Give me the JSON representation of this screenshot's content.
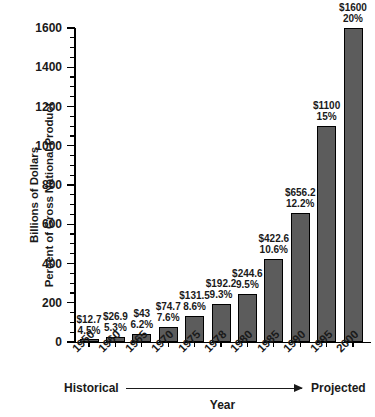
{
  "chart_data": {
    "type": "bar",
    "title": "",
    "xlabel": "Year",
    "ylabel": "Billions of Dollars Percent of Gross National Product",
    "ylabel_lines": [
      "Billions of Dollars",
      "Percent of Gross National Product"
    ],
    "ylim": [
      0,
      1600
    ],
    "ytick_step": 200,
    "yminor_step": 50,
    "grid": false,
    "legend": "none",
    "categories": [
      "1950",
      "1960",
      "1965",
      "1970",
      "1975",
      "1978",
      "1980",
      "1985",
      "1990",
      "1995",
      "2000"
    ],
    "values": [
      12.7,
      26.9,
      43,
      74.7,
      131.5,
      192.2,
      244.6,
      422.6,
      656.2,
      1100,
      1600
    ],
    "ytick_labels": [
      "1600",
      "1400",
      "1200",
      "1000",
      "800",
      "600",
      "400",
      "200",
      "0"
    ],
    "series": [
      {
        "name": "Billions of Dollars",
        "values": [
          12.7,
          26.9,
          43,
          74.7,
          131.5,
          192.2,
          244.6,
          422.6,
          656.2,
          1100,
          1600
        ]
      },
      {
        "name": "Percent of Gross National Product",
        "values": [
          4.5,
          5.3,
          6.2,
          7.6,
          8.6,
          9.3,
          9.5,
          10.6,
          12.2,
          15,
          20
        ]
      }
    ],
    "point_labels": [
      {
        "year": "1950",
        "amount": "$12.7",
        "percent": "4.5%"
      },
      {
        "year": "1960",
        "amount": "$26.9",
        "percent": "5.3%"
      },
      {
        "year": "1965",
        "amount": "$43",
        "percent": "6.2%"
      },
      {
        "year": "1970",
        "amount": "$74.7",
        "percent": "7.6%"
      },
      {
        "year": "1975",
        "amount": "$131.5",
        "percent": "8.6%"
      },
      {
        "year": "1978",
        "amount": "$192.2",
        "percent": "9.3%"
      },
      {
        "year": "1980",
        "amount": "$244.6",
        "percent": "9.5%"
      },
      {
        "year": "1985",
        "amount": "$422.6",
        "percent": "10.6%"
      },
      {
        "year": "1990",
        "amount": "$656.2",
        "percent": "12.2%"
      },
      {
        "year": "1995",
        "amount": "$1100",
        "percent": "15%"
      },
      {
        "year": "2000",
        "amount": "$1600",
        "percent": "20%"
      }
    ],
    "annotations": {
      "historical": "Historical",
      "projected": "Projected"
    },
    "colors": {
      "bar_fill": "#5c5c5c",
      "bar_stroke": "#000000",
      "axis": "#000000",
      "text": "#1a1a1a",
      "background": "#ffffff"
    }
  }
}
